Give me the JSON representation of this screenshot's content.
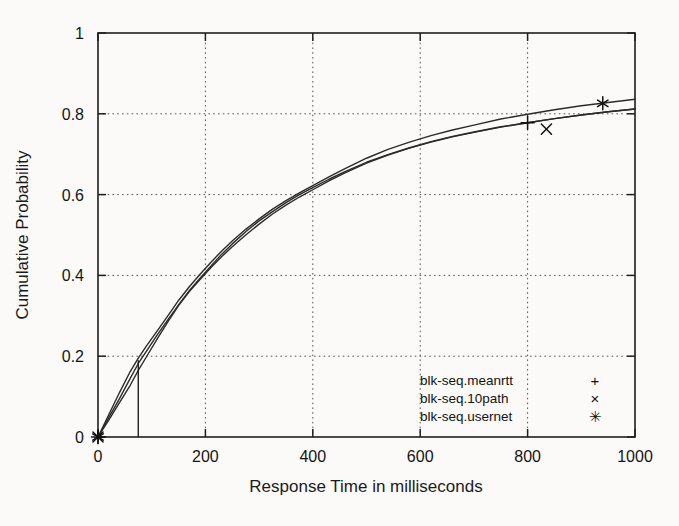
{
  "chart_data": {
    "type": "line",
    "title": "",
    "xlabel": "Response Time in milliseconds",
    "ylabel": "Cumulative Probability",
    "xlim": [
      0,
      1000
    ],
    "ylim": [
      0,
      1
    ],
    "xticks": [
      0,
      200,
      400,
      600,
      800,
      1000
    ],
    "yticks": [
      0,
      0.2,
      0.4,
      0.6,
      0.8,
      1
    ],
    "xtick_labels": [
      "0",
      "200",
      "400",
      "600",
      "800",
      "1000"
    ],
    "ytick_labels": [
      "0",
      "0.2",
      "0.4",
      "0.6",
      "0.8",
      "1"
    ],
    "grid": true,
    "grid_style": "dotted",
    "legend_position": "bottom-right",
    "line_color": "#2b2b2b",
    "series": [
      {
        "name": "blk-seq.meanrtt",
        "marker": "+",
        "marker_glyph": "+",
        "x": [
          0,
          20,
          40,
          60,
          75,
          90,
          110,
          130,
          150,
          170,
          190,
          210,
          230,
          250,
          275,
          300,
          325,
          350,
          375,
          400,
          430,
          460,
          500,
          540,
          580,
          620,
          660,
          700,
          750,
          800,
          850,
          900,
          950,
          1000
        ],
        "y": [
          0,
          0.048,
          0.095,
          0.145,
          0.182,
          0.212,
          0.252,
          0.29,
          0.327,
          0.362,
          0.393,
          0.423,
          0.452,
          0.478,
          0.508,
          0.535,
          0.558,
          0.58,
          0.6,
          0.617,
          0.638,
          0.657,
          0.68,
          0.699,
          0.716,
          0.731,
          0.744,
          0.755,
          0.768,
          0.778,
          0.788,
          0.797,
          0.805,
          0.812
        ],
        "markers": [
          {
            "x": 0,
            "y": 0
          },
          {
            "x": 800,
            "y": 0.778
          }
        ]
      },
      {
        "name": "blk-seq.10path",
        "marker": "x",
        "marker_glyph": "×",
        "x": [
          0,
          20,
          40,
          60,
          75,
          90,
          110,
          130,
          150,
          170,
          190,
          210,
          230,
          250,
          275,
          300,
          325,
          350,
          375,
          400,
          430,
          460,
          500,
          540,
          580,
          620,
          660,
          700,
          750,
          800,
          850,
          900,
          950,
          1000
        ],
        "y": [
          0,
          0.042,
          0.085,
          0.128,
          0.165,
          0.198,
          0.242,
          0.285,
          0.325,
          0.36,
          0.39,
          0.419,
          0.446,
          0.471,
          0.5,
          0.527,
          0.552,
          0.574,
          0.594,
          0.612,
          0.634,
          0.654,
          0.678,
          0.698,
          0.715,
          0.73,
          0.743,
          0.754,
          0.767,
          0.778,
          0.788,
          0.797,
          0.805,
          0.812
        ],
        "markers": [
          {
            "x": 0,
            "y": 0
          },
          {
            "x": 835,
            "y": 0.762
          }
        ]
      },
      {
        "name": "blk-seq.usernet",
        "marker": "*",
        "marker_glyph": "✳",
        "x": [
          0,
          20,
          40,
          60,
          75,
          90,
          110,
          130,
          150,
          170,
          190,
          210,
          230,
          250,
          275,
          300,
          325,
          350,
          375,
          400,
          430,
          460,
          500,
          540,
          580,
          620,
          660,
          700,
          750,
          800,
          850,
          900,
          950,
          1000
        ],
        "y": [
          0,
          0.055,
          0.11,
          0.162,
          0.195,
          0.225,
          0.262,
          0.3,
          0.338,
          0.372,
          0.403,
          0.432,
          0.46,
          0.485,
          0.514,
          0.54,
          0.564,
          0.585,
          0.604,
          0.622,
          0.644,
          0.664,
          0.69,
          0.712,
          0.73,
          0.746,
          0.76,
          0.772,
          0.787,
          0.799,
          0.81,
          0.82,
          0.828,
          0.836
        ],
        "markers": [
          {
            "x": 0,
            "y": 0
          },
          {
            "x": 940,
            "y": 0.826
          }
        ]
      }
    ],
    "annotations": [
      {
        "type": "vertical-line",
        "x": 75,
        "y_start": 0,
        "y_end": 0.19
      }
    ]
  },
  "legend": {
    "entries": [
      {
        "label": "blk-seq.meanrtt",
        "marker": "+"
      },
      {
        "label": "blk-seq.10path",
        "marker": "×"
      },
      {
        "label": "blk-seq.usernet",
        "marker": "✳"
      }
    ]
  }
}
